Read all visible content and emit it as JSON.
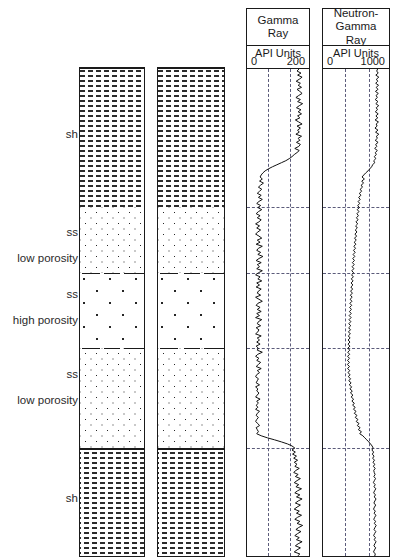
{
  "figure": {
    "type": "well-log-lithology-panel",
    "width": 395,
    "height": 558
  },
  "lithology_labels": [
    {
      "id": "sh-upper",
      "lines": [
        "sh"
      ],
      "y": 128
    },
    {
      "id": "ss-low-1",
      "lines": [
        "ss",
        "low porosity"
      ],
      "y": 232
    },
    {
      "id": "ss-high",
      "lines": [
        "ss",
        "high porosity"
      ],
      "y": 292
    },
    {
      "id": "ss-low-2",
      "lines": [
        "ss",
        "low porosity"
      ],
      "y": 370
    },
    {
      "id": "sh-lower",
      "lines": [
        "sh"
      ],
      "y": 492
    }
  ],
  "lithology_units": [
    {
      "name": "shale-upper",
      "pattern": "shale",
      "top": 68,
      "bottom": 206
    },
    {
      "name": "sandstone-low-1",
      "pattern": "ss-low",
      "top": 206,
      "bottom": 272
    },
    {
      "name": "sandstone-high",
      "pattern": "ss-high",
      "top": 272,
      "bottom": 347
    },
    {
      "name": "sandstone-low-2",
      "pattern": "ss-low",
      "top": 347,
      "bottom": 447
    },
    {
      "name": "shale-lower",
      "pattern": "shale",
      "top": 447,
      "bottom": 556
    }
  ],
  "columns": [
    {
      "name": "lithology-column-1",
      "x": 79,
      "width": 66
    },
    {
      "name": "lithology-column-2",
      "x": 157,
      "width": 68
    }
  ],
  "tracks": [
    {
      "name": "gamma-ray",
      "title": "Gamma Ray",
      "title_lines": [
        "Gamma",
        "Ray"
      ],
      "units": "API Units",
      "scale_min": "0",
      "scale_max": "200",
      "x": 246,
      "width": 64
    },
    {
      "name": "neutron-gamma-ray",
      "title": "Neutron-Gamma Ray",
      "title_lines": [
        "Neutron-",
        "Gamma",
        "Ray"
      ],
      "units": "API Units",
      "scale_min": "0",
      "scale_max": "1000",
      "x": 322,
      "width": 68
    }
  ],
  "gridlines": {
    "horizontal_depths": [
      206,
      272,
      347,
      447
    ],
    "vertical_fractions": [
      0.33,
      0.66
    ]
  },
  "chart_data": {
    "type": "line",
    "xlabel": "API Units",
    "ylabel": "Depth",
    "grid": true,
    "legend": "none",
    "series": [
      {
        "name": "Gamma Ray",
        "units": "API Units",
        "xlim": [
          0,
          200
        ],
        "note": "high in shale, low in sandstone",
        "values": [
          175,
          168,
          182,
          170,
          186,
          176,
          165,
          180,
          172,
          184,
          168,
          178,
          186,
          174,
          164,
          180,
          170,
          188,
          176,
          166,
          182,
          172,
          184,
          170,
          178,
          162,
          174,
          186,
          168,
          180,
          170,
          176,
          164,
          184,
          172,
          178,
          166,
          180,
          174,
          160,
          176,
          168,
          158,
          150,
          140,
          128,
          112,
          96,
          80,
          66,
          54,
          46,
          40,
          36,
          44,
          34,
          48,
          38,
          30,
          42,
          34,
          26,
          40,
          30,
          44,
          32,
          24,
          38,
          28,
          42,
          30,
          22,
          36,
          26,
          40,
          32,
          20,
          34,
          24,
          38,
          28,
          20,
          32,
          42,
          26,
          36,
          22,
          44,
          30,
          24,
          38,
          28,
          46,
          32,
          22,
          40,
          26,
          34,
          24,
          44,
          30,
          20,
          36,
          28,
          42,
          24,
          34,
          22,
          40,
          30,
          26,
          38,
          20,
          32,
          44,
          28,
          22,
          36,
          26,
          40,
          24,
          34,
          20,
          42,
          30,
          26,
          38,
          22,
          32,
          28,
          20,
          40,
          26,
          34,
          24,
          36,
          22,
          30,
          26,
          44,
          28,
          20,
          32,
          24,
          38,
          30,
          22,
          40,
          26,
          34,
          24,
          20,
          30,
          26,
          22,
          34,
          20,
          28,
          24,
          32,
          26,
          20,
          36,
          24,
          30,
          22,
          28,
          20,
          34,
          26,
          22,
          30,
          24,
          20,
          28,
          34,
          22,
          26,
          30,
          24,
          40,
          62,
          88,
          112,
          134,
          150,
          160,
          150,
          162,
          152,
          166,
          156,
          170,
          158,
          168,
          160,
          176,
          164,
          156,
          172,
          162,
          180,
          168,
          158,
          174,
          164,
          184,
          170,
          160,
          178,
          166,
          186,
          172,
          162,
          180,
          168,
          158,
          176,
          166,
          184,
          170,
          160,
          178,
          168,
          188,
          174,
          164,
          182,
          170,
          160,
          176,
          166,
          186,
          172,
          162,
          180,
          168,
          158,
          178,
          170
        ]
      },
      {
        "name": "Neutron-Gamma Ray",
        "units": "API Units",
        "xlim": [
          0,
          1000
        ],
        "note": "moderate-high in shale, lowest in low-porosity sand trend",
        "values": [
          860,
          845,
          870,
          830,
          880,
          840,
          862,
          828,
          876,
          836,
          866,
          824,
          872,
          834,
          856,
          820,
          866,
          830,
          878,
          838,
          858,
          822,
          870,
          832,
          862,
          818,
          874,
          836,
          852,
          816,
          866,
          826,
          880,
          840,
          856,
          820,
          868,
          828,
          846,
          812,
          856,
          822,
          838,
          806,
          830,
          796,
          810,
          778,
          760,
          730,
          700,
          662,
          630,
          600,
          640,
          596,
          626,
          586,
          608,
          570,
          594,
          556,
          582,
          544,
          570,
          536,
          562,
          528,
          556,
          522,
          548,
          516,
          540,
          508,
          534,
          500,
          528,
          494,
          522,
          488,
          516,
          482,
          510,
          476,
          504,
          470,
          498,
          464,
          492,
          458,
          486,
          452,
          480,
          446,
          474,
          440,
          470,
          436,
          464,
          430,
          460,
          426,
          456,
          422,
          452,
          418,
          448,
          414,
          444,
          410,
          440,
          406,
          436,
          402,
          432,
          398,
          428,
          394,
          424,
          390,
          420,
          386,
          418,
          384,
          414,
          380,
          412,
          378,
          408,
          374,
          406,
          372,
          402,
          368,
          400,
          366,
          398,
          364,
          396,
          362,
          394,
          360,
          392,
          358,
          390,
          356,
          392,
          360,
          396,
          366,
          402,
          372,
          410,
          380,
          418,
          388,
          428,
          398,
          438,
          408,
          448,
          420,
          460,
          432,
          472,
          444,
          486,
          458,
          500,
          472,
          516,
          488,
          532,
          504,
          550,
          522,
          568,
          540,
          590,
          562,
          614,
          646,
          680,
          712,
          742,
          768,
          786,
          766,
          794,
          772,
          800,
          778,
          808,
          784,
          812,
          790,
          820,
          796,
          804,
          818,
          798,
          826,
          806,
          790,
          820,
          800,
          830,
          810,
          794,
          824,
          804,
          834,
          814,
          798,
          828,
          808,
          792,
          822,
          802,
          832,
          812,
          796,
          826,
          806,
          836,
          816,
          800,
          830,
          810,
          794,
          824,
          804,
          834,
          814,
          798,
          828,
          808,
          792,
          822,
          812
        ]
      }
    ]
  }
}
